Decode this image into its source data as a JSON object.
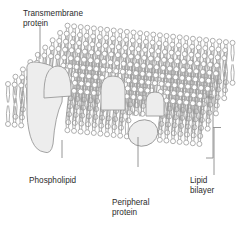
{
  "figure": {
    "background_color": "#ffffff",
    "width": 247,
    "height": 226
  },
  "labels": {
    "transmembrane_protein": "Transmembrane\nprotein",
    "phospholipid": "Phospholipid",
    "peripheral_protein": "Peripheral\nprotein",
    "lipid_bilayer": "Lipid\nbilayer"
  },
  "colors": {
    "text": "#2b2b2b",
    "outline": "#8a8a8a",
    "lipid_stroke": "#9a9a9a",
    "protein_fill": "#ededed",
    "protein_stroke": "#9a9a9a",
    "leader_line": "#8a8a8a",
    "bracket": "#8a8a8a",
    "head_fill": "#ffffff"
  },
  "leaders": {
    "transmembrane": {
      "x": 40,
      "y": 26,
      "length": 33
    },
    "phospholipid": {
      "x": 62,
      "y": 158,
      "length": 18
    },
    "peripheral": {
      "x": 138,
      "y": 167,
      "length": 30
    },
    "bilayer": {
      "x": 214,
      "y": 128,
      "length": 47
    }
  },
  "bracket": {
    "x": 206,
    "y_top": 97,
    "y_bottom": 158,
    "depth": 7,
    "tick": 8
  },
  "geometry": {
    "note": "3D perspective slab: top face recedes up-right, rows of phospholipids",
    "rows": 9,
    "head_radius": 2.5,
    "tail_length": 16,
    "row_dx": 1.7,
    "row_dy": -7.5,
    "front_left_x": 8,
    "front_top_y": 84,
    "front_right_x": 200,
    "front_right_top_y": 104,
    "columns_front": 26
  },
  "proteins": [
    {
      "name": "transmembrane-protein",
      "kind": "transmembrane",
      "cx": 46,
      "cy": 108,
      "rx": 19,
      "ry": 44
    },
    {
      "name": "transmembrane-protein-lobe",
      "kind": "transmembrane-lobe",
      "cx": 58,
      "cy": 82,
      "rx": 14,
      "ry": 16
    },
    {
      "name": "integral-protein-dome-center",
      "kind": "dome",
      "cx": 113,
      "cy": 93,
      "rx": 12,
      "ry": 17
    },
    {
      "name": "integral-protein-dome-right",
      "kind": "dome",
      "cx": 155,
      "cy": 104,
      "rx": 9,
      "ry": 12
    },
    {
      "name": "peripheral-protein",
      "kind": "peripheral",
      "cx": 143,
      "cy": 133,
      "rx": 15,
      "ry": 13
    }
  ],
  "chart_data": {
    "type": "diagram",
    "components": [
      {
        "label": "Transmembrane\nprotein",
        "position": "upper-left, spans both leaflets"
      },
      {
        "label": "Phospholipid",
        "position": "lower-left, individual lipid molecule"
      },
      {
        "label": "Peripheral\nprotein",
        "position": "bottom-center, attached to inner leaflet"
      },
      {
        "label": "Lipid\nbilayer",
        "position": "right, bracket spanning membrane thickness"
      }
    ],
    "layers": [
      "outer leaflet (upper)",
      "hydrophobic tail core",
      "inner leaflet (lower)"
    ]
  }
}
